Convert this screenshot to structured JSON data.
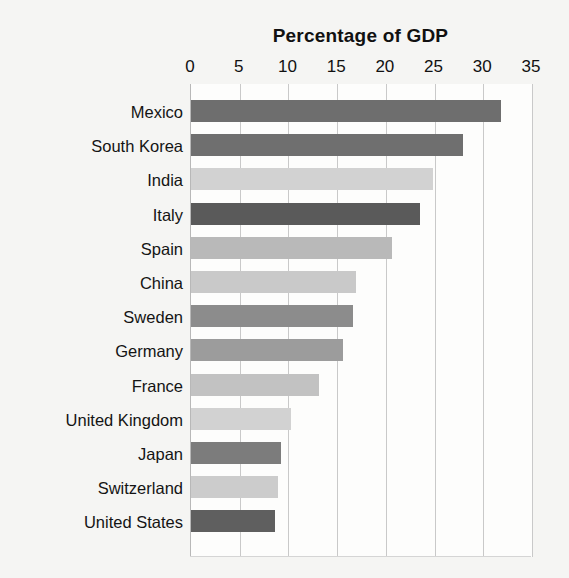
{
  "chart_data": {
    "type": "bar",
    "orientation": "horizontal",
    "title": "Percentage of GDP",
    "subtitle": "",
    "xlabel": "",
    "ylabel": "",
    "xlim": [
      0,
      35
    ],
    "ylim": null,
    "grid": true,
    "legend": null,
    "legend_position": "none",
    "x_ticks": [
      0,
      5,
      10,
      15,
      20,
      25,
      30,
      35
    ],
    "x_tick_labels": [
      "0",
      "5",
      "10",
      "15",
      "20",
      "25",
      "30",
      "35"
    ],
    "categories": [
      "Mexico",
      "South Korea",
      "India",
      "Italy",
      "Spain",
      "China",
      "Sweden",
      "Germany",
      "France",
      "United Kingdom",
      "Japan",
      "Switzerland",
      "United States"
    ],
    "values": [
      31.8,
      27.9,
      24.8,
      23.5,
      20.6,
      16.9,
      16.6,
      15.6,
      13.1,
      10.3,
      9.2,
      8.9,
      8.6
    ],
    "bar_colors": [
      "#6e6e6e",
      "#6f6f6f",
      "#d2d2d2",
      "#5a5a5a",
      "#b9b9b9",
      "#c9c9c9",
      "#8c8c8c",
      "#9c9c9c",
      "#c2c2c2",
      "#d2d2d2",
      "#7c7c7c",
      "#cccccc",
      "#5f5f5f"
    ],
    "annotations": []
  },
  "style": {
    "page_background": "#f5f5f3",
    "plot_background": "#fdfdfc",
    "gridline_color": "#c9c9c9",
    "axis_color": "#b8b8b8",
    "text_color": "#111111"
  }
}
